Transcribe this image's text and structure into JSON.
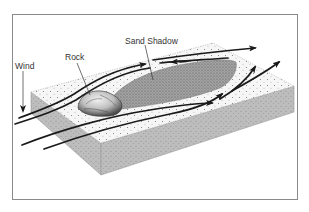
{
  "diagram": {
    "type": "block-diagram",
    "labels": {
      "wind": "Wind",
      "rock": "Rock",
      "sand_shadow": "Sand Shadow"
    },
    "colors": {
      "frame": "#8a8a8a",
      "top_face": "#f4f4f4",
      "side_face": "#b9b9b9",
      "shadow_fill": "#8f8f8f",
      "arrows": "#1a1a1a",
      "text": "#333333"
    }
  }
}
